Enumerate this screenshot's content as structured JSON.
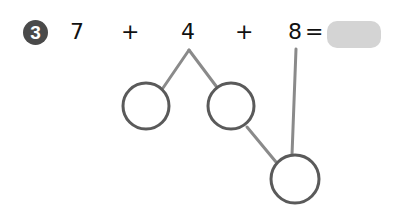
{
  "problem": {
    "number": "3",
    "terms": [
      "7",
      "4",
      "8"
    ],
    "operators": [
      "+",
      "+"
    ],
    "equals": "=",
    "answer": ""
  },
  "colors": {
    "badge": "#4a4a4a",
    "circle_stroke": "#5a5a5a",
    "line": "#8a8a8a",
    "answer_box": "#d4d4d4"
  },
  "diagram": {
    "circles": [
      {
        "name": "left-partial-sum-circle",
        "cx": 146,
        "cy": 106,
        "r": 23
      },
      {
        "name": "right-partial-sum-circle",
        "cx": 231,
        "cy": 106,
        "r": 23
      },
      {
        "name": "total-sum-circle",
        "cx": 295,
        "cy": 179,
        "r": 24
      }
    ]
  }
}
